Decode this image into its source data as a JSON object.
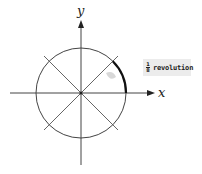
{
  "diagram": {
    "axes": {
      "x_label": "x",
      "y_label": "y"
    },
    "callout": {
      "numerator": "1",
      "denominator": "8",
      "text": "revolution"
    },
    "circle": {
      "divisions": 8,
      "highlighted_arc_degrees": [
        0,
        45
      ]
    },
    "colors": {
      "line": "#444444",
      "arc": "#111111",
      "callout_bg": "#ececec"
    }
  }
}
